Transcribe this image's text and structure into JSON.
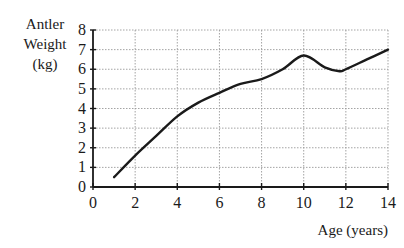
{
  "chart_data": {
    "type": "line",
    "title": "",
    "xlabel": "Age (years)",
    "ylabel_lines": [
      "Antler",
      "Weight",
      "(kg)"
    ],
    "xlim": [
      0,
      14
    ],
    "ylim": [
      0,
      8
    ],
    "x_ticks": [
      "0",
      "2",
      "4",
      "6",
      "8",
      "10",
      "12",
      "14"
    ],
    "y_ticks": [
      "0",
      "1",
      "2",
      "3",
      "4",
      "5",
      "6",
      "7",
      "8"
    ],
    "grid": true,
    "series": [
      {
        "name": "Antler Weight",
        "x": [
          1,
          2,
          3,
          4,
          5,
          6,
          7,
          8,
          9,
          10,
          11,
          11.7,
          12,
          13,
          14
        ],
        "values": [
          0.5,
          1.6,
          2.6,
          3.6,
          4.3,
          4.8,
          5.25,
          5.5,
          6.0,
          6.7,
          6.1,
          5.9,
          6.0,
          6.5,
          7.0
        ]
      }
    ]
  }
}
